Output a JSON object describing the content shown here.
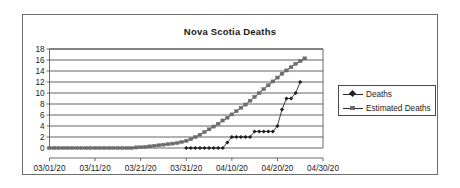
{
  "chart_data": {
    "type": "line",
    "title": "Nova Scotia Deaths",
    "xlabel": "",
    "ylabel": "",
    "grid": true,
    "legend_position": "right",
    "ylim": [
      0,
      18
    ],
    "yticks": [
      0,
      2,
      4,
      6,
      8,
      10,
      12,
      14,
      16,
      18
    ],
    "xtick_labels": [
      "03/01/20",
      "03/11/20",
      "03/21/20",
      "03/31/20",
      "04/10/20",
      "04/20/20",
      "04/30/20"
    ],
    "x_start": "03/01/20",
    "x_end": "04/30/20",
    "x_day_count": 61,
    "series": [
      {
        "name": "Deaths",
        "marker": "diamond",
        "color": "#1f1f1f",
        "x_day_offsets": [
          30,
          31,
          32,
          33,
          34,
          35,
          36,
          37,
          38,
          39,
          40,
          41,
          42,
          43,
          44,
          45,
          46,
          47,
          48,
          49,
          50,
          51,
          52,
          53,
          54,
          55
        ],
        "values": [
          0,
          0,
          0,
          0,
          0,
          0,
          0,
          0,
          0,
          1,
          2,
          2,
          2,
          2,
          2,
          3,
          3,
          3,
          3,
          3,
          4,
          7,
          9,
          9,
          10,
          12
        ]
      },
      {
        "name": "Estimated Deaths",
        "marker": "square",
        "color": "#6b6b6b",
        "x_day_offsets": [
          0,
          1,
          2,
          3,
          4,
          5,
          6,
          7,
          8,
          9,
          10,
          11,
          12,
          13,
          14,
          15,
          16,
          17,
          18,
          19,
          20,
          21,
          22,
          23,
          24,
          25,
          26,
          27,
          28,
          29,
          30,
          31,
          32,
          33,
          34,
          35,
          36,
          37,
          38,
          39,
          40,
          41,
          42,
          43,
          44,
          45,
          46,
          47,
          48,
          49,
          50,
          51,
          52,
          53,
          54,
          55,
          56
        ],
        "values": [
          0,
          0,
          0,
          0,
          0,
          0,
          0,
          0,
          0,
          0,
          0,
          0,
          0,
          0,
          0,
          0,
          0,
          0,
          0,
          0.1,
          0.15,
          0.2,
          0.3,
          0.4,
          0.5,
          0.6,
          0.7,
          0.8,
          0.9,
          1.1,
          1.3,
          1.6,
          2.0,
          2.4,
          2.9,
          3.4,
          3.9,
          4.4,
          5.0,
          5.5,
          6.1,
          6.7,
          7.3,
          7.9,
          8.6,
          9.3,
          10.0,
          10.7,
          11.4,
          12.1,
          12.8,
          13.5,
          14.1,
          14.7,
          15.3,
          15.8,
          16.3
        ]
      }
    ]
  },
  "legend": {
    "items": [
      {
        "label": "Deaths"
      },
      {
        "label": "Estimated Deaths"
      }
    ]
  }
}
